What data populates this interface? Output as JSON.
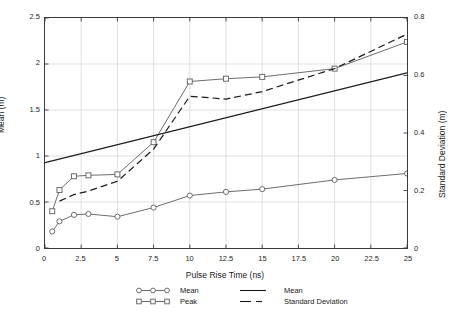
{
  "chart_data": {
    "type": "line",
    "title": "",
    "xlabel": "Pulse Rise Time (ns)",
    "ylabel": "Mean (m)",
    "ylabel_right": "Standard Deviation (m)",
    "xlim": [
      0,
      25
    ],
    "ylim": [
      0,
      2.5
    ],
    "ylim_right": [
      0,
      0.8
    ],
    "grid": true,
    "legend_position": "bottom",
    "xticks": [
      0,
      2.5,
      5,
      7.5,
      10,
      12.5,
      15,
      17.5,
      20,
      22.5,
      25
    ],
    "xticklabels": [
      "0",
      "2.5",
      "5",
      "7.5",
      "10",
      "12.5",
      "15",
      "17.5",
      "20",
      "22.5",
      "25"
    ],
    "yticks": [
      0,
      0.5,
      1,
      1.5,
      2,
      2.5
    ],
    "yticklabels": [
      "0",
      "0.5",
      "1",
      "1.5",
      "2",
      "2.5"
    ],
    "yticks_right": [
      0,
      0.2,
      0.4,
      0.6,
      0.8
    ],
    "yticklabels_right": [
      "0",
      "0.2",
      "0.4",
      "0.6",
      "0.8"
    ],
    "series": [
      {
        "name": "Mean",
        "legend_label": "Mean",
        "axis": "left",
        "marker": "circle",
        "linestyle": "solid",
        "color": "#6b6b6b",
        "x": [
          0.5,
          1,
          2,
          3,
          5,
          7.5,
          10,
          12.5,
          15,
          20,
          25
        ],
        "values": [
          0.18,
          0.29,
          0.36,
          0.37,
          0.34,
          0.44,
          0.57,
          0.61,
          0.64,
          0.74,
          0.81
        ]
      },
      {
        "name": "Peak",
        "legend_label": "Peak",
        "axis": "left",
        "marker": "square",
        "linestyle": "solid",
        "color": "#6b6b6b",
        "x": [
          0.5,
          1,
          2,
          3,
          5,
          7.5,
          10,
          12.5,
          15,
          20,
          25
        ],
        "values": [
          0.4,
          0.63,
          0.78,
          0.79,
          0.8,
          1.15,
          1.81,
          1.84,
          1.86,
          1.95,
          2.24
        ]
      },
      {
        "name": "Mean (fit)",
        "legend_label": "Mean",
        "axis": "right",
        "marker": "none",
        "linestyle": "solid",
        "color": "#1a1a1a",
        "x": [
          0,
          25
        ],
        "values": [
          0.297,
          0.609
        ]
      },
      {
        "name": "Standard Deviation",
        "legend_label": "Standard Deviation",
        "axis": "right",
        "marker": "none",
        "linestyle": "dashed",
        "color": "#1a1a1a",
        "x": [
          1,
          2,
          3,
          5,
          7.5,
          10,
          12.5,
          15,
          20,
          25
        ],
        "values": [
          0.163,
          0.186,
          0.198,
          0.232,
          0.344,
          0.528,
          0.518,
          0.544,
          0.624,
          0.744
        ]
      }
    ],
    "legend": [
      {
        "label": "Mean",
        "marker": "circle",
        "linestyle": "solid",
        "color": "#6b6b6b"
      },
      {
        "label": "Mean",
        "marker": "none",
        "linestyle": "solid",
        "color": "#1a1a1a"
      },
      {
        "label": "Peak",
        "marker": "square",
        "linestyle": "solid",
        "color": "#6b6b6b"
      },
      {
        "label": "Standard Deviation",
        "marker": "none",
        "linestyle": "dashed",
        "color": "#1a1a1a"
      }
    ]
  }
}
